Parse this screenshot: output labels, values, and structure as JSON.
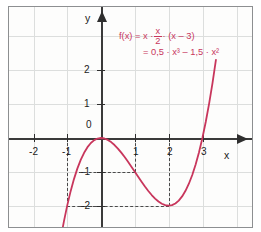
{
  "chart_data": {
    "type": "line",
    "title": "",
    "xlabel": "x",
    "ylabel": "y",
    "xlim": [
      -2.7,
      3.9
    ],
    "ylim": [
      -2.6,
      3.2
    ],
    "grid": true,
    "legend": "none",
    "curve_color": "#c8365c",
    "axis_color": "#2f2f2f",
    "grid_color": "#dcdedd",
    "function_expression": "f(x) = 0.5*x^3 - 1.5*x^2",
    "x_ticks": [
      "-2",
      "-1",
      "0",
      "1",
      "2",
      "3"
    ],
    "x_tick_values": [
      -2,
      -1,
      0,
      1,
      2,
      3
    ],
    "y_ticks": [
      "-2",
      "-1",
      "0",
      "1",
      "2"
    ],
    "y_tick_values": [
      -2,
      -1,
      0,
      1,
      2
    ],
    "points": [
      {
        "x": -1,
        "y": -2,
        "note": "marked with dashed guides"
      },
      {
        "x": 0,
        "y": 0,
        "note": "local maximum and root"
      },
      {
        "x": 1,
        "y": -1,
        "note": "marked with dashed guides"
      },
      {
        "x": 2,
        "y": -2,
        "note": "local minimum, marked with dashed guides"
      },
      {
        "x": 3,
        "y": 0,
        "note": "root"
      }
    ],
    "x": [
      -1.2,
      -1.1,
      -1.0,
      -0.9,
      -0.8,
      -0.7,
      -0.6,
      -0.5,
      -0.4,
      -0.3,
      -0.2,
      -0.1,
      0.0,
      0.1,
      0.2,
      0.3,
      0.4,
      0.5,
      0.6,
      0.7,
      0.8,
      0.9,
      1.0,
      1.1,
      1.2,
      1.3,
      1.4,
      1.5,
      1.6,
      1.7,
      1.8,
      1.9,
      2.0,
      2.1,
      2.2,
      2.3,
      2.4,
      2.5,
      2.6,
      2.7,
      2.8,
      2.9,
      3.0,
      3.1,
      3.2,
      3.3,
      3.4
    ],
    "y": [
      -3.024,
      -2.4805,
      -2.0,
      -1.5795,
      -1.216,
      -0.9065,
      -0.648,
      -0.4375,
      -0.272,
      -0.1485,
      -0.064,
      -0.0155,
      0.0,
      -0.0145,
      -0.056,
      -0.1215,
      -0.208,
      -0.3125,
      -0.432,
      -0.5635,
      -0.704,
      -0.8505,
      -1.0,
      -1.1495,
      -1.296,
      -1.4365,
      -1.568,
      -1.6875,
      -1.792,
      -1.8785,
      -1.944,
      -1.9855,
      -2.0,
      -1.9845,
      -1.936,
      -1.8515,
      -1.728,
      -1.5625,
      -1.352,
      -1.0935,
      -0.784,
      -0.4205,
      0.0,
      0.4805,
      1.024,
      1.6335,
      2.312
    ]
  },
  "formula": {
    "line1_prefix": "f(x) = x ·",
    "frac_num": "x",
    "frac_den": "2",
    "line1_suffix": "· (x – 3)",
    "line2": "= 0,5 · x³ – 1,5 · x²"
  },
  "axes": {
    "x_label": "x",
    "y_label": "y",
    "origin_label": "0"
  }
}
